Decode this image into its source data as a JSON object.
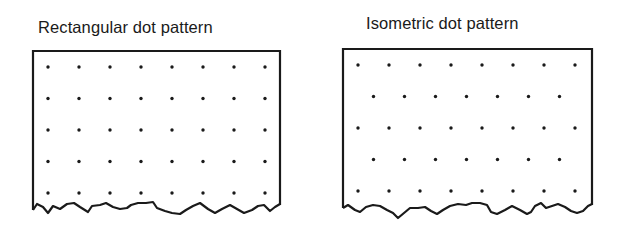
{
  "panels": [
    {
      "title": "Rectangular dot pattern",
      "pattern": "rectangular",
      "rows": 5,
      "columns": [
        8,
        8,
        8,
        8,
        8
      ]
    },
    {
      "title": "Isometric dot pattern",
      "pattern": "isometric",
      "rows": 5,
      "columns": [
        8,
        7,
        8,
        7,
        8
      ]
    }
  ],
  "colors": {
    "ink": "#1a1a1a",
    "paper": "#ffffff"
  }
}
